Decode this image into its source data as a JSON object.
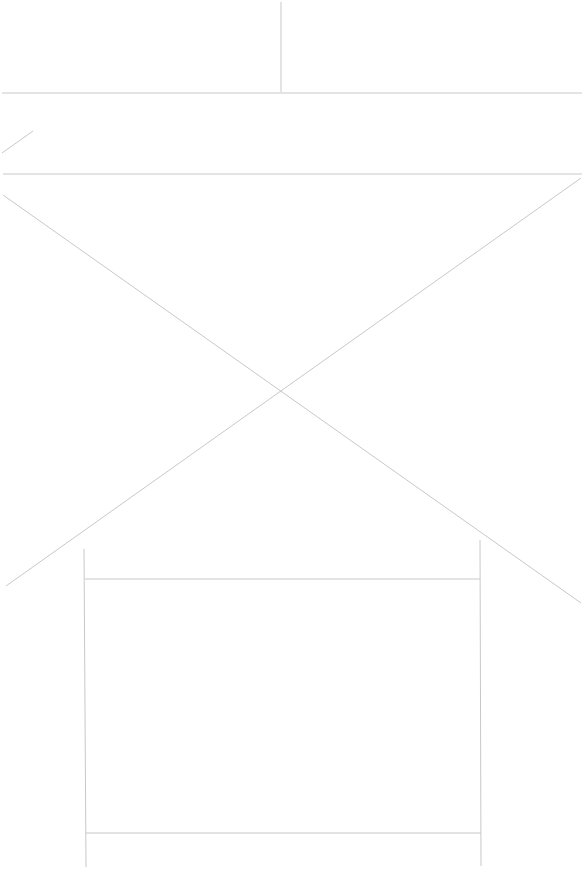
{
  "canvas": {
    "width": 584,
    "height": 869,
    "background": "#ffffff"
  },
  "style": {
    "line_color": "#c8c8c8",
    "line_width": 1
  },
  "lines": [
    {
      "id": "top-divider-vertical",
      "x1": 281,
      "y1": 2,
      "x2": 281,
      "y2": 92
    },
    {
      "id": "header-bottom-rule",
      "x1": 2,
      "y1": 93,
      "x2": 582,
      "y2": 93
    },
    {
      "id": "small-diagonal-mark",
      "x1": 2,
      "y1": 153,
      "x2": 33,
      "y2": 131
    },
    {
      "id": "section-top-rule",
      "x1": 3,
      "y1": 174,
      "x2": 582,
      "y2": 174
    },
    {
      "id": "cross-diagonal-down",
      "x1": 3,
      "y1": 195,
      "x2": 581,
      "y2": 603
    },
    {
      "id": "cross-diagonal-up",
      "x1": 581,
      "y1": 178,
      "x2": 6,
      "y2": 586
    },
    {
      "id": "box-left-edge",
      "x1": 84,
      "y1": 549,
      "x2": 86,
      "y2": 867
    },
    {
      "id": "box-right-edge",
      "x1": 480,
      "y1": 540,
      "x2": 481,
      "y2": 866
    },
    {
      "id": "box-top-rule",
      "x1": 85,
      "y1": 579,
      "x2": 480,
      "y2": 579
    },
    {
      "id": "box-bottom-rule",
      "x1": 86,
      "y1": 833,
      "x2": 481,
      "y2": 833
    }
  ]
}
